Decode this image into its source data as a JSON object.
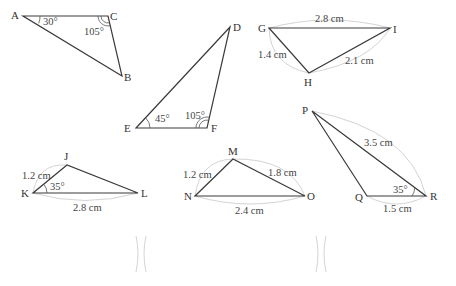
{
  "triangles": [
    {
      "id": "ABC",
      "vertices": {
        "A": "A",
        "B": "B",
        "C": "C"
      },
      "angles": {
        "A": "30°",
        "C": "105°"
      }
    },
    {
      "id": "DEF",
      "vertices": {
        "D": "D",
        "E": "E",
        "F": "F"
      },
      "angles": {
        "E": "45°",
        "F": "105°"
      }
    },
    {
      "id": "GHI",
      "vertices": {
        "G": "G",
        "H": "H",
        "I": "I"
      },
      "sides": {
        "GI": "2.8 cm",
        "GH": "1.4 cm",
        "HI": "2.1 cm"
      }
    },
    {
      "id": "JKL",
      "vertices": {
        "J": "J",
        "K": "K",
        "L": "L"
      },
      "sides": {
        "JK": "1.2 cm",
        "KL": "2.8 cm"
      },
      "angles": {
        "K": "35°"
      }
    },
    {
      "id": "MNO",
      "vertices": {
        "M": "M",
        "N": "N",
        "O": "O"
      },
      "sides": {
        "MN": "1.2 cm",
        "MO": "1.8 cm",
        "NO": "2.4 cm"
      }
    },
    {
      "id": "PQR",
      "vertices": {
        "P": "P",
        "Q": "Q",
        "R": "R"
      },
      "sides": {
        "PR": "3.5 cm",
        "QR": "1.5 cm"
      },
      "angles": {
        "R": "35°"
      }
    }
  ]
}
